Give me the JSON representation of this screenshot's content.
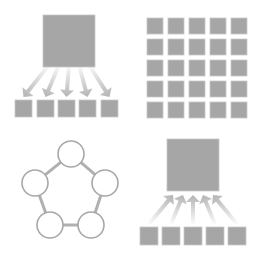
{
  "diagram": {
    "title": "",
    "colors": {
      "background": "#ffffff",
      "square_fill": "#a6a6a6",
      "square_stroke": "#c8c8c8",
      "arrow_color": "#b4b4b4",
      "circle_stroke": "#a8a8a8",
      "connector": "#b0b0b0"
    },
    "panels": [
      {
        "id": "one-to-many",
        "description": "Large square distributing via five arrows down to five small squares",
        "big_square": {
          "x": 43,
          "y": 15,
          "size": 52
        },
        "arrow_direction": "down",
        "arrows": 5,
        "small_squares": [
          {
            "x": 15,
            "y": 100
          },
          {
            "x": 37,
            "y": 100
          },
          {
            "x": 58,
            "y": 100
          },
          {
            "x": 79,
            "y": 100
          },
          {
            "x": 101,
            "y": 100
          }
        ],
        "small_size": 17
      },
      {
        "id": "grid",
        "description": "5x5 grid of small squares",
        "rows": 5,
        "cols": 5,
        "origin": {
          "x": 147,
          "y": 18
        },
        "pitch": 21,
        "size": 16
      },
      {
        "id": "ring",
        "description": "Five circles connected in a pentagon ring",
        "nodes": [
          {
            "cx": 71,
            "cy": 154
          },
          {
            "cx": 105,
            "cy": 183
          },
          {
            "cx": 91,
            "cy": 225
          },
          {
            "cx": 50,
            "cy": 225
          },
          {
            "cx": 35,
            "cy": 183
          }
        ],
        "radius": 13
      },
      {
        "id": "many-to-one",
        "description": "Five small squares converging via five arrows up into one large square",
        "big_square": {
          "x": 167,
          "y": 139,
          "size": 52
        },
        "arrow_direction": "up",
        "arrows": 5,
        "small_squares": [
          {
            "x": 140,
            "y": 227
          },
          {
            "x": 162,
            "y": 227
          },
          {
            "x": 184,
            "y": 227
          },
          {
            "x": 206,
            "y": 227
          },
          {
            "x": 228,
            "y": 227
          }
        ],
        "small_size": 18
      }
    ]
  }
}
